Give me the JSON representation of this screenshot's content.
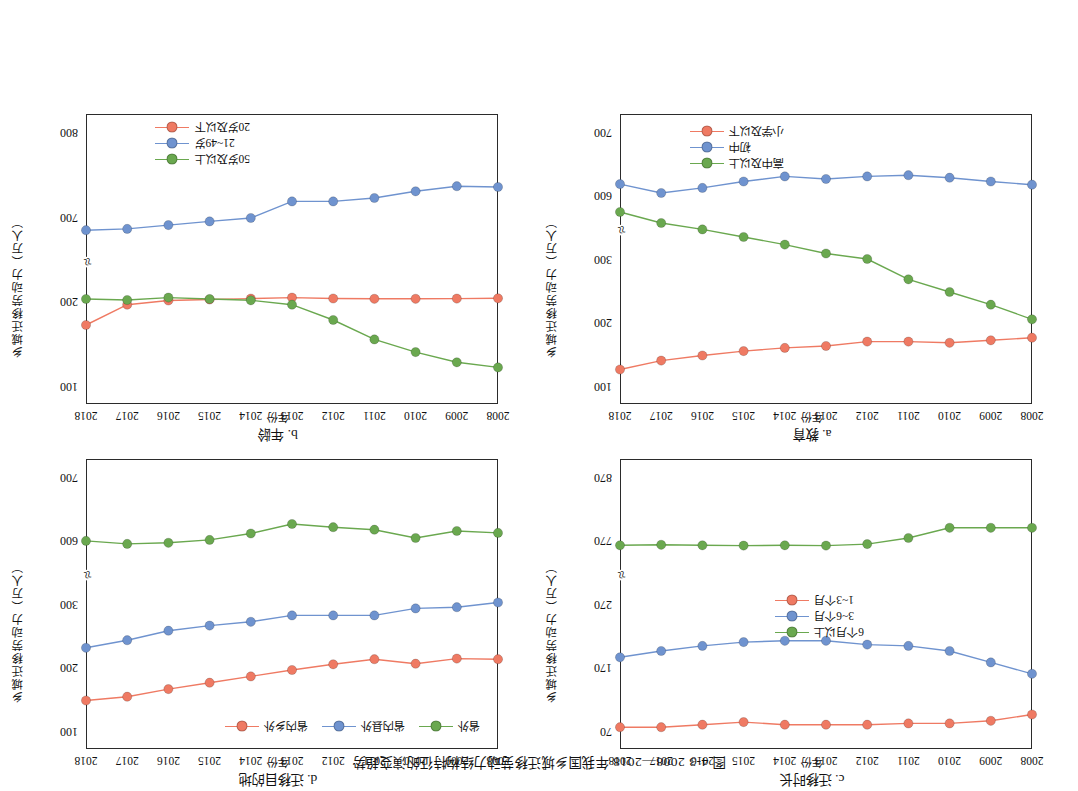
{
  "figure": {
    "caption": "图 4-3  2008—2018 年我国乡城迁移劳动力结构特征的演变趋势",
    "axis_y_label": "乡城迁移劳动力（万人）",
    "axis_x_label": "年份",
    "colors": {
      "red": "#ef7a63",
      "blue": "#6f93cf",
      "green": "#6aa84f",
      "axis": "#2b2b2b"
    }
  },
  "chart_data": [
    {
      "id": "a",
      "type": "line",
      "title": "a. 教育",
      "xlabel": "年份",
      "ylabel": "乡城迁移劳动力（万人）",
      "categories": [
        "2008",
        "2009",
        "2010",
        "2011",
        "2012",
        "2013",
        "2014",
        "2015",
        "2016",
        "2017",
        "2018"
      ],
      "yticks": [
        "100",
        "200",
        "300",
        "600",
        "700"
      ],
      "ylim": [
        700,
        100
      ],
      "axis_break": true,
      "grid": false,
      "legend_position": "bottom-right",
      "series": [
        {
          "name": "小学及以下",
          "color": "#ef7a63",
          "values": [
            176,
            172,
            168,
            170,
            170,
            163,
            160,
            155,
            148,
            140,
            126
          ]
        },
        {
          "name": "初中",
          "color": "#6f93cf",
          "values": [
            617,
            622,
            628,
            632,
            630,
            626,
            630,
            622,
            612,
            604,
            618
          ]
        },
        {
          "name": "高中及以上",
          "color": "#6aa84f",
          "values": [
            205,
            228,
            248,
            268,
            300,
            326,
            368,
            404,
            440,
            470,
            522
          ]
        }
      ]
    },
    {
      "id": "b",
      "type": "line",
      "title": "b. 年龄",
      "xlabel": "年份",
      "ylabel": "乡城迁移劳动力（万人）",
      "categories": [
        "2008",
        "2009",
        "2010",
        "2011",
        "2012",
        "2013",
        "2014",
        "2015",
        "2016",
        "2017",
        "2018"
      ],
      "yticks": [
        "100",
        "200",
        "700",
        "800"
      ],
      "ylim": [
        800,
        100
      ],
      "axis_break": true,
      "grid": false,
      "legend_position": "bottom-right",
      "series": [
        {
          "name": "20岁及以下",
          "color": "#ef7a63",
          "values": [
            218,
            216,
            215,
            215,
            217,
            222,
            216,
            211,
            205,
            196,
            172
          ]
        },
        {
          "name": "21~49岁",
          "color": "#6f93cf",
          "values": [
            735,
            736,
            730,
            722,
            718,
            718,
            692,
            672,
            650,
            628,
            620
          ]
        },
        {
          "name": "50岁及以上",
          "color": "#6aa84f",
          "values": [
            122,
            128,
            140,
            155,
            178,
            196,
            206,
            214,
            222,
            208,
            214
          ]
        }
      ]
    },
    {
      "id": "c",
      "type": "line",
      "title": "c. 迁移时长",
      "xlabel": "年份",
      "ylabel": "乡城迁移劳动力（万人）",
      "categories": [
        "2008",
        "2009",
        "2010",
        "2011",
        "2012",
        "2013",
        "2014",
        "2015",
        "2016",
        "2017",
        "2018"
      ],
      "yticks": [
        "70",
        "170",
        "270",
        "770",
        "870"
      ],
      "ylim": [
        870,
        70
      ],
      "axis_break": true,
      "grid": false,
      "legend_position": "middle-right",
      "series": [
        {
          "name": "1~3个月",
          "color": "#ef7a63",
          "values": [
            96,
            86,
            82,
            82,
            80,
            80,
            80,
            84,
            80,
            76,
            76
          ]
        },
        {
          "name": "3~6个月",
          "color": "#6f93cf",
          "values": [
            160,
            178,
            196,
            204,
            206,
            212,
            212,
            210,
            204,
            196,
            186
          ]
        },
        {
          "name": "6个月以上",
          "color": "#6aa84f",
          "values": [
            790,
            790,
            790,
            774,
            742,
            730,
            732,
            730,
            732,
            736,
            732
          ]
        }
      ]
    },
    {
      "id": "d",
      "type": "line",
      "title": "d. 迁移目的地",
      "xlabel": "年份",
      "ylabel": "乡城迁移劳动力（万人）",
      "categories": [
        "2008",
        "2009",
        "2010",
        "2011",
        "2012",
        "2013",
        "2014",
        "2015",
        "2016",
        "2017",
        "2018"
      ],
      "yticks": [
        "100",
        "200",
        "300",
        "600",
        "700"
      ],
      "ylim": [
        700,
        100
      ],
      "axis_break": true,
      "grid": false,
      "legend_position": "top-left",
      "series": [
        {
          "name": "省内乡外",
          "color": "#ef7a63",
          "values": [
            213,
            214,
            206,
            213,
            205,
            196,
            186,
            176,
            166,
            154,
            148
          ]
        },
        {
          "name": "省内县外",
          "color": "#6f93cf",
          "values": [
            307,
            295,
            293,
            282,
            282,
            282,
            272,
            266,
            258,
            243,
            231
          ]
        },
        {
          "name": "省外",
          "color": "#6aa84f",
          "values": [
            612,
            615,
            604,
            617,
            621,
            626,
            611,
            601,
            589,
            584,
            598
          ]
        }
      ]
    }
  ],
  "panels": {
    "d": {
      "legend": [
        "省外",
        "省内县外",
        "省内乡外"
      ]
    },
    "c": {
      "legend": [
        "6个月以上",
        "3~6个月",
        "1~3个月"
      ]
    },
    "b": {
      "legend": [
        "50岁及以上",
        "21~49岁",
        "20岁及以下"
      ]
    },
    "a": {
      "legend": [
        "高中及以上",
        "初中",
        "小学及以下"
      ]
    }
  }
}
